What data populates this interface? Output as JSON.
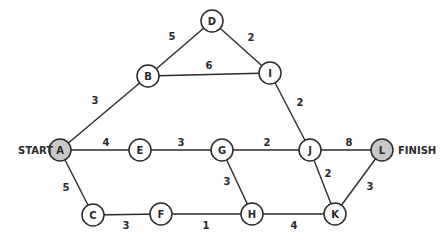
{
  "diagram": {
    "type": "network-graph",
    "start_label": "START",
    "finish_label": "FINISH",
    "colors": {
      "line": "#2a2a2a",
      "endpoint_fill": "#c8c8c8",
      "node_fill": "#ffffff"
    },
    "nodes": [
      {
        "id": "A",
        "label": "A",
        "x": 60,
        "y": 150,
        "endpoint": true
      },
      {
        "id": "B",
        "label": "B",
        "x": 148,
        "y": 76
      },
      {
        "id": "C",
        "label": "C",
        "x": 93,
        "y": 215
      },
      {
        "id": "D",
        "label": "D",
        "x": 212,
        "y": 21
      },
      {
        "id": "E",
        "label": "E",
        "x": 140,
        "y": 150
      },
      {
        "id": "F",
        "label": "F",
        "x": 161,
        "y": 214
      },
      {
        "id": "G",
        "label": "G",
        "x": 222,
        "y": 150
      },
      {
        "id": "H",
        "label": "H",
        "x": 252,
        "y": 214
      },
      {
        "id": "I",
        "label": "I",
        "x": 270,
        "y": 73
      },
      {
        "id": "J",
        "label": "J",
        "x": 310,
        "y": 150
      },
      {
        "id": "K",
        "label": "K",
        "x": 335,
        "y": 214
      },
      {
        "id": "L",
        "label": "L",
        "x": 382,
        "y": 150,
        "endpoint": true
      }
    ],
    "edges": [
      {
        "from": "A",
        "to": "B",
        "weight": "3",
        "lx": 95,
        "ly": 104
      },
      {
        "from": "B",
        "to": "D",
        "weight": "5",
        "lx": 172,
        "ly": 40
      },
      {
        "from": "D",
        "to": "I",
        "weight": "2",
        "lx": 251,
        "ly": 41
      },
      {
        "from": "B",
        "to": "I",
        "weight": "6",
        "lx": 209,
        "ly": 69
      },
      {
        "from": "I",
        "to": "J",
        "weight": "2",
        "lx": 300,
        "ly": 106
      },
      {
        "from": "A",
        "to": "E",
        "weight": "4",
        "lx": 106,
        "ly": 146
      },
      {
        "from": "E",
        "to": "G",
        "weight": "3",
        "lx": 181,
        "ly": 146
      },
      {
        "from": "G",
        "to": "J",
        "weight": "2",
        "lx": 267,
        "ly": 146
      },
      {
        "from": "J",
        "to": "L",
        "weight": "8",
        "lx": 349,
        "ly": 146
      },
      {
        "from": "A",
        "to": "C",
        "weight": "5",
        "lx": 66,
        "ly": 191
      },
      {
        "from": "C",
        "to": "F",
        "weight": "3",
        "lx": 126,
        "ly": 229
      },
      {
        "from": "F",
        "to": "H",
        "weight": "1",
        "lx": 206,
        "ly": 229
      },
      {
        "from": "G",
        "to": "H",
        "weight": "3",
        "lx": 227,
        "ly": 185
      },
      {
        "from": "H",
        "to": "K",
        "weight": "4",
        "lx": 294,
        "ly": 229
      },
      {
        "from": "J",
        "to": "K",
        "weight": "2",
        "lx": 328,
        "ly": 177
      },
      {
        "from": "K",
        "to": "L",
        "weight": "3",
        "lx": 370,
        "ly": 190
      }
    ]
  }
}
